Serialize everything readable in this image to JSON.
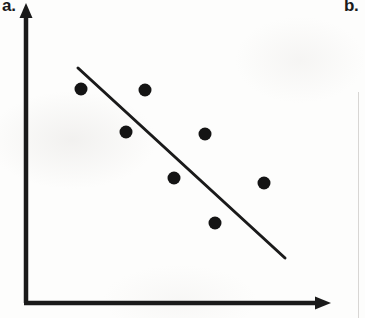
{
  "figure": {
    "panels": [
      {
        "label": "a.",
        "name": "panel-a-scatter-negative"
      },
      {
        "label": "b.",
        "name": "panel-b-partial"
      }
    ],
    "background_color": "#fdfdfc",
    "ink_color": "#1a1a1a"
  },
  "axes": {
    "y_axis": {
      "x": 26,
      "y_top": 8,
      "y_bottom": 303,
      "stroke_width": 4,
      "arrow": "up"
    },
    "x_axis": {
      "y": 303,
      "x_left": 26,
      "x_right": 331,
      "stroke_width": 4,
      "arrow": "right"
    },
    "tick_labels_x": [],
    "tick_labels_y": [],
    "xlabel": "",
    "ylabel": ""
  },
  "chart_data": {
    "type": "scatter",
    "title": "",
    "subtitle": "",
    "xlabel": "",
    "ylabel": "",
    "xlim": [
      0,
      100
    ],
    "ylim": [
      0,
      100
    ],
    "grid": false,
    "legend": null,
    "annotations": [
      "a.",
      "b."
    ],
    "axis_ticks": {
      "x": [],
      "y": []
    },
    "marker": {
      "shape": "circle",
      "radius_px": 6.5,
      "color": "#141414"
    },
    "points_px": [
      {
        "x": 81,
        "y": 89
      },
      {
        "x": 145,
        "y": 90
      },
      {
        "x": 126,
        "y": 132
      },
      {
        "x": 205,
        "y": 134
      },
      {
        "x": 174,
        "y": 178
      },
      {
        "x": 264,
        "y": 183
      },
      {
        "x": 215,
        "y": 223
      }
    ],
    "x": [
      18,
      39,
      33,
      59,
      49,
      78,
      62
    ],
    "y": [
      73,
      72,
      58,
      58,
      42,
      41,
      27
    ],
    "series": [
      {
        "name": "observations",
        "x": [
          18,
          39,
          33,
          59,
          49,
          78,
          62
        ],
        "y": [
          73,
          72,
          58,
          58,
          42,
          41,
          27
        ]
      }
    ],
    "trendline": {
      "name": "line-of-best-fit",
      "direction": "negative",
      "x_px": [
        78,
        285
      ],
      "y_px": [
        68,
        258
      ],
      "x": [
        17,
        84
      ],
      "y": [
        80,
        19
      ],
      "stroke_width": 3,
      "color": "#1a1a1a"
    },
    "relationship": "negative correlation"
  }
}
